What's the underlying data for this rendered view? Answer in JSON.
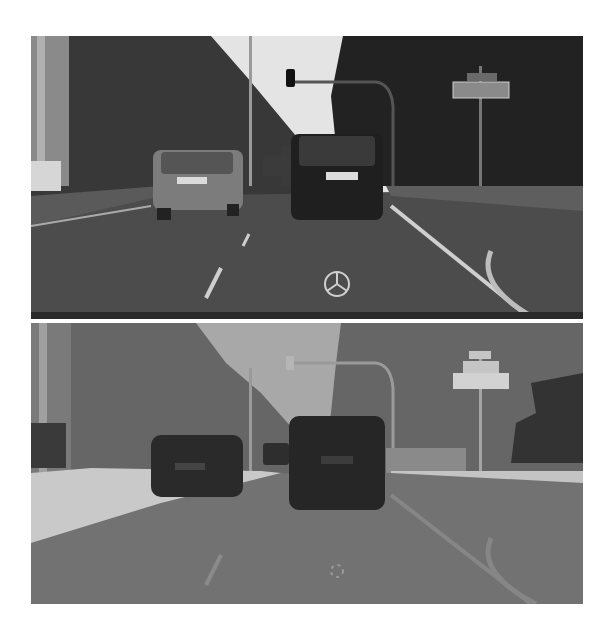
{
  "figure": {
    "panels": [
      {
        "id": "photo",
        "kind": "street-scene-photograph",
        "description": "Grayscale dashcam view of an urban road with two cars ahead, traffic light, trees, road sign and vehicle hood ornament"
      },
      {
        "id": "segmentation",
        "kind": "semantic-segmentation-output",
        "description": "Grayscale semantic label map of the same scene: sky, vegetation, cars, road, sidewalk, poles, sign"
      }
    ],
    "colors": {
      "background": "#ffffff",
      "photo_sky": "#e6e6e6",
      "photo_trees": "#2e2e2e",
      "photo_road": "#4a4a4a",
      "photo_car_left": "#7a7a7a",
      "photo_car_right": "#1f1f1f",
      "seg_sky": "#a8a8a8",
      "seg_vegetation": "#686868",
      "seg_road": "#727272",
      "seg_sidewalk": "#c9c9c9",
      "seg_car": "#2a2a2a",
      "seg_sign": "#d2d2d2",
      "seg_pole": "#9a9a9a"
    }
  }
}
